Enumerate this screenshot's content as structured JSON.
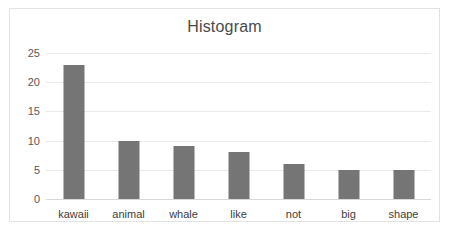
{
  "chart_data": {
    "type": "bar",
    "title": "Histogram",
    "xlabel": "",
    "ylabel": "",
    "categories": [
      "kawaii",
      "animal",
      "whale",
      "like",
      "not",
      "big",
      "shape"
    ],
    "values": [
      23,
      10,
      9,
      8,
      6,
      5,
      5
    ],
    "ylim": [
      0,
      25
    ],
    "ytick_values": [
      0,
      5,
      10,
      15,
      20,
      25
    ],
    "ytick_labels": [
      "0",
      "5",
      "10",
      "15",
      "20",
      "25"
    ],
    "grid": true,
    "legend": false,
    "bar_color": "#757575",
    "gridline_color": "#e9e9e9",
    "title_color": "#4a4a4a",
    "border_color": "#e2e2e2",
    "background_color": "#ffffff"
  }
}
